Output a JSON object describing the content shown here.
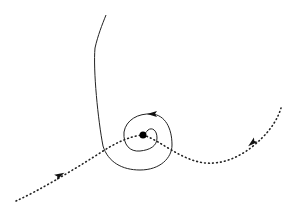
{
  "diagram": {
    "type": "phase-portrait",
    "background": "#ffffff",
    "stroke_color": "#222222",
    "elements": {
      "fixed_point": {
        "cx": 143,
        "cy": 135,
        "r": 3.5
      },
      "stable_manifold_left": {
        "style": "dotted",
        "path": "M16,201 C40,190 70,172 100,153 C115,143 130,136 143,135"
      },
      "unstable_manifold_right": {
        "style": "dotted",
        "path": "M143,135 C160,140 180,160 205,163 C230,165 250,150 262,138 C272,128 278,118 281,108"
      },
      "spiral_trajectory": {
        "style": "solid",
        "path": "M106,15 C102,25 98,35 95,48 C93,70 98,120 103,146 C108,162 122,170 140,170 C160,170 172,158 172,145 C172,128 165,115 152,114 C138,113 126,120 124,132 C123,145 130,152 140,151 C150,150 157,146 157,138 C157,130 152,127 148,130 C146,132 145,134 143,135"
      },
      "arrows": [
        {
          "name": "left-manifold-arrow",
          "x": 60,
          "y": 175,
          "angle": -28
        },
        {
          "name": "right-manifold-arrow",
          "x": 252,
          "y": 143,
          "angle": 140
        },
        {
          "name": "spiral-top-arrow",
          "x": 152,
          "y": 114,
          "angle": 180
        }
      ]
    }
  }
}
